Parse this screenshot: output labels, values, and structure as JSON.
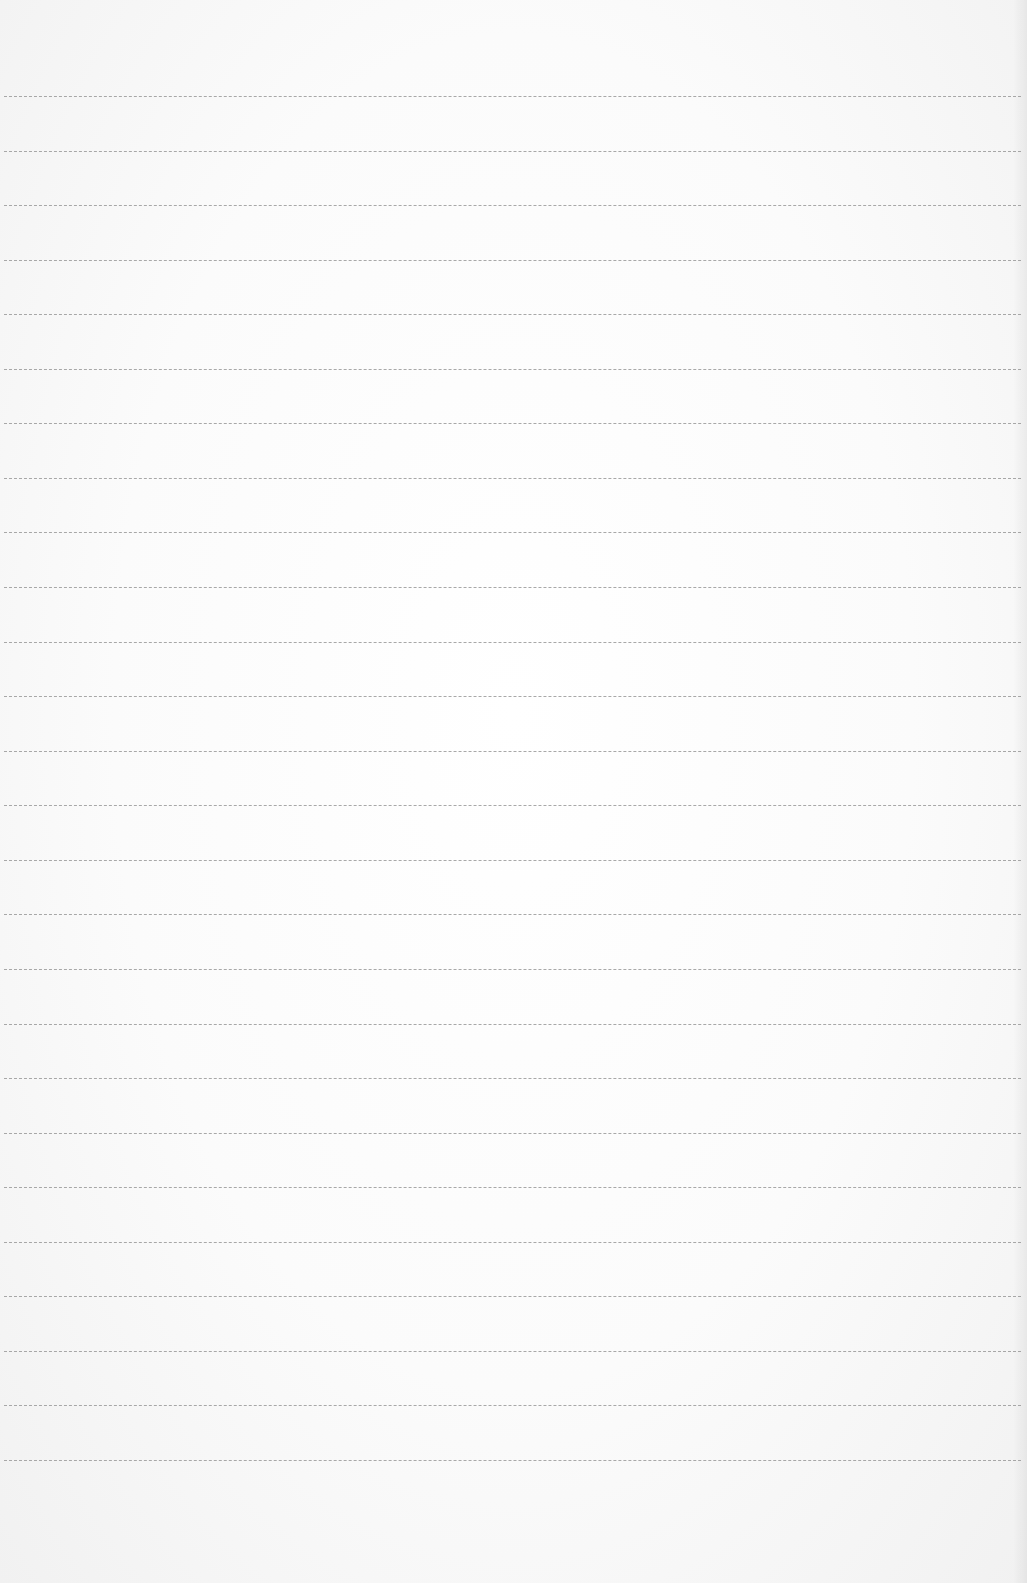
{
  "page": {
    "type": "blank-lined-paper",
    "background_color": "#fbfbfb",
    "rule_color": "#9a9a9a",
    "rules": {
      "count": 26,
      "first_y": 96,
      "spacing": 54.6
    }
  }
}
